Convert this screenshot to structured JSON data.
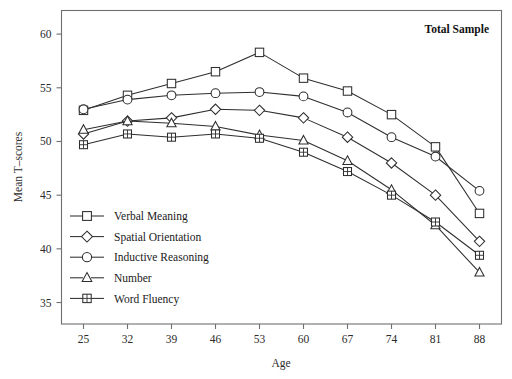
{
  "chart_data": {
    "type": "line",
    "title": "Total Sample",
    "xlabel": "Age",
    "ylabel": "Mean T–scores",
    "x": [
      25,
      32,
      39,
      46,
      53,
      60,
      67,
      74,
      81,
      88
    ],
    "xticklabels": [
      "25",
      "32",
      "39",
      "46",
      "53",
      "60",
      "67",
      "74",
      "81",
      "88"
    ],
    "yticks": [
      35,
      40,
      45,
      50,
      55,
      60
    ],
    "yticklabels": [
      "35",
      "40",
      "45",
      "50",
      "55",
      "60"
    ],
    "xlim": [
      21.5,
      91.5
    ],
    "ylim": [
      33.0,
      62.2
    ],
    "grid": false,
    "legend_position": "lower-left-inside",
    "series": [
      {
        "name": "Verbal Meaning",
        "marker": "square",
        "values": [
          52.9,
          54.3,
          55.4,
          56.5,
          58.3,
          55.9,
          54.7,
          52.5,
          49.5,
          43.3
        ]
      },
      {
        "name": "Spatial Orientation",
        "marker": "diamond",
        "values": [
          50.7,
          51.9,
          52.2,
          53.0,
          52.9,
          52.2,
          50.4,
          48.0,
          45.0,
          40.7
        ]
      },
      {
        "name": "Inductive Reasoning",
        "marker": "circle",
        "values": [
          53.0,
          53.9,
          54.3,
          54.5,
          54.6,
          54.2,
          52.7,
          50.4,
          48.6,
          45.4
        ]
      },
      {
        "name": "Number",
        "marker": "triangle",
        "values": [
          51.1,
          51.9,
          51.7,
          51.4,
          50.6,
          50.1,
          48.2,
          45.5,
          42.2,
          37.8
        ]
      },
      {
        "name": "Word Fluency",
        "marker": "crossed-square",
        "values": [
          49.7,
          50.7,
          50.4,
          50.7,
          50.3,
          49.0,
          47.2,
          45.0,
          42.5,
          39.4
        ]
      }
    ]
  },
  "colors": {
    "line": "#2e2e2e",
    "frame": "#6f6f6f",
    "background": "#ffffff",
    "text": "#1a1a1a"
  }
}
